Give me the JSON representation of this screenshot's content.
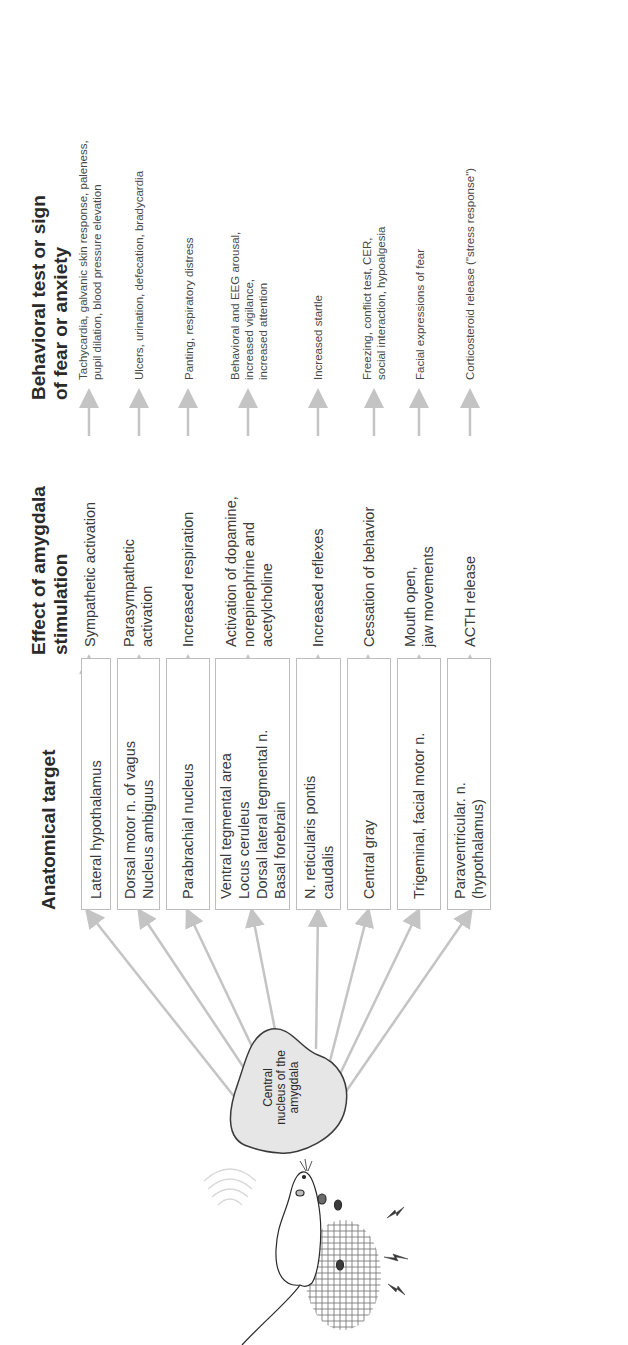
{
  "headers": {
    "anatomical_target": "Anatomical target",
    "effect": "Effect of amygdala\nstimulation",
    "behavioral": "Behavioral test or sign\nof fear or anxiety"
  },
  "source_node": {
    "label": "Central\nnucleus of the\namygdala",
    "fill": "#e6e6e6"
  },
  "stimulus": {
    "description": "rat on electrified grid with shock symbols",
    "icons": [
      "rat-icon",
      "grid-icon",
      "lightning-icon",
      "lightning-icon",
      "lightning-icon",
      "sound-waves-icon"
    ]
  },
  "rows": [
    {
      "target": "Lateral hypothalamus",
      "effect": "Sympathetic activation",
      "behavior": "Tachycardia, galvanic skin response, paleness,\npupil dilation, blood pressure elevation"
    },
    {
      "target": "Dorsal motor n. of vagus\nNucleus ambiguus",
      "effect": "Parasympathetic\nactivation",
      "behavior": "Ulcers, urination, defecation, bradycardia"
    },
    {
      "target": "Parabrachial nucleus",
      "effect": "Increased respiration",
      "behavior": "Panting, respiratory distress"
    },
    {
      "target": "Ventral tegmental area\nLocus ceruleus\nDorsal lateral tegmental n.\nBasal forebrain",
      "effect": "Activation of dopamine,\nnorepinephrine and\nacetylcholine",
      "behavior": "Behavioral and EEG arousal,\nincreased vigilance,\nincreased attention"
    },
    {
      "target": "N. reticularis pontis\ncaudalis",
      "effect": "Increased reflexes",
      "behavior": "Increased startle"
    },
    {
      "target": "Central gray",
      "effect": "Cessation of behavior",
      "behavior": "Freezing, conflict test, CER,\nsocial interaction, hypoalgesia"
    },
    {
      "target": "Trigeminal, facial motor n.",
      "effect": "Mouth open,\njaw movements",
      "behavior": "Facial expressions of fear"
    },
    {
      "target": "Paraventricular. n.\n(hypothalamus)",
      "effect": "ACTH release",
      "behavior": "Corticosteroid release (\"stress response\")"
    }
  ],
  "colors": {
    "arrow": "#c4c4c4",
    "box_border": "#bdbdbd",
    "text": "#3a3a3a"
  }
}
